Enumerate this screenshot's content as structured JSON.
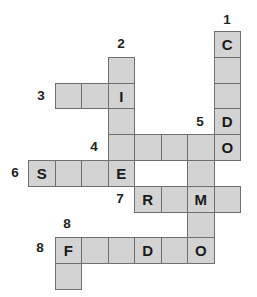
{
  "canvas": {
    "width": 257,
    "height": 297,
    "background": "#fefefe"
  },
  "puzzle": {
    "type": "crossword",
    "colors": {
      "cell_fill": "#d3d3d3",
      "cell_border": "#6f6f6f",
      "letter": "#1a1a1a",
      "number": "#222222"
    },
    "grid": {
      "rows": 10,
      "cols": 8,
      "origin_x": 28,
      "origin_y": 31,
      "cell_width": 26.5,
      "cell_height": 25.8
    },
    "cells": [
      {
        "row": 0,
        "col": 7,
        "letter": "C"
      },
      {
        "row": 1,
        "col": 3,
        "letter": ""
      },
      {
        "row": 1,
        "col": 7,
        "letter": ""
      },
      {
        "row": 2,
        "col": 1,
        "letter": ""
      },
      {
        "row": 2,
        "col": 2,
        "letter": ""
      },
      {
        "row": 2,
        "col": 3,
        "letter": "I"
      },
      {
        "row": 2,
        "col": 7,
        "letter": ""
      },
      {
        "row": 3,
        "col": 3,
        "letter": ""
      },
      {
        "row": 3,
        "col": 7,
        "letter": "D"
      },
      {
        "row": 4,
        "col": 3,
        "letter": ""
      },
      {
        "row": 4,
        "col": 4,
        "letter": ""
      },
      {
        "row": 4,
        "col": 5,
        "letter": ""
      },
      {
        "row": 4,
        "col": 6,
        "letter": ""
      },
      {
        "row": 4,
        "col": 7,
        "letter": "O"
      },
      {
        "row": 5,
        "col": 0,
        "letter": "S"
      },
      {
        "row": 5,
        "col": 1,
        "letter": ""
      },
      {
        "row": 5,
        "col": 2,
        "letter": ""
      },
      {
        "row": 5,
        "col": 3,
        "letter": "E"
      },
      {
        "row": 5,
        "col": 6,
        "letter": ""
      },
      {
        "row": 6,
        "col": 4,
        "letter": "R"
      },
      {
        "row": 6,
        "col": 5,
        "letter": ""
      },
      {
        "row": 6,
        "col": 6,
        "letter": "M"
      },
      {
        "row": 6,
        "col": 7,
        "letter": ""
      },
      {
        "row": 7,
        "col": 6,
        "letter": ""
      },
      {
        "row": 8,
        "col": 1,
        "letter": "F"
      },
      {
        "row": 8,
        "col": 2,
        "letter": ""
      },
      {
        "row": 8,
        "col": 3,
        "letter": ""
      },
      {
        "row": 8,
        "col": 4,
        "letter": "D"
      },
      {
        "row": 8,
        "col": 5,
        "letter": ""
      },
      {
        "row": 8,
        "col": 6,
        "letter": "O"
      },
      {
        "row": 9,
        "col": 1,
        "letter": ""
      }
    ],
    "clue_numbers": [
      {
        "number": "1",
        "direction": "down",
        "x": 227,
        "y": 20
      },
      {
        "number": "2",
        "direction": "down",
        "x": 121,
        "y": 44
      },
      {
        "number": "3",
        "direction": "across",
        "x": 41,
        "y": 96
      },
      {
        "number": "5",
        "direction": "down",
        "x": 200,
        "y": 122
      },
      {
        "number": "4",
        "direction": "across",
        "x": 94,
        "y": 147
      },
      {
        "number": "6",
        "direction": "across",
        "x": 15,
        "y": 173
      },
      {
        "number": "7",
        "direction": "across",
        "x": 120,
        "y": 199
      },
      {
        "number": "8",
        "direction": "down",
        "x": 67,
        "y": 224
      },
      {
        "number": "8",
        "direction": "across",
        "x": 40,
        "y": 248
      }
    ],
    "entries": [
      {
        "number": "1",
        "direction": "down",
        "pattern": "C__DO"
      },
      {
        "number": "2",
        "direction": "down",
        "pattern": "_I__E"
      },
      {
        "number": "3",
        "direction": "across",
        "pattern": "__I"
      },
      {
        "number": "4",
        "direction": "across",
        "pattern": "____O"
      },
      {
        "number": "5",
        "direction": "down",
        "pattern": "__M_O"
      },
      {
        "number": "6",
        "direction": "across",
        "pattern": "S__E"
      },
      {
        "number": "7",
        "direction": "across",
        "pattern": "R_M_"
      },
      {
        "number": "8",
        "direction": "across",
        "pattern": "F__D_O"
      },
      {
        "number": "8",
        "direction": "down",
        "pattern": "F_"
      }
    ]
  }
}
